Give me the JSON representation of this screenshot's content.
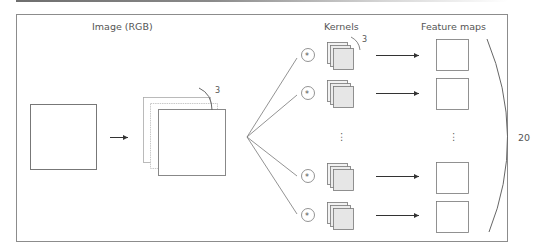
{
  "diagram": {
    "labels": {
      "image": "Image (RGB)",
      "kernels": "Kernels",
      "feature_maps": "Feature maps"
    },
    "channel_count": "3",
    "kernel_depth": "3",
    "feature_map_count": "20",
    "operator_symbol": "*",
    "ellipsis": "⋮",
    "rows": [
      {
        "kernel": "kernel-1",
        "feature_map": "feature-map-1"
      },
      {
        "kernel": "kernel-2",
        "feature_map": "feature-map-2"
      },
      {
        "kernel": "kernel-19",
        "feature_map": "feature-map-19"
      },
      {
        "kernel": "kernel-20",
        "feature_map": "feature-map-20"
      }
    ],
    "icons": {
      "convolution": "circled-asterisk-icon",
      "arrow": "right-arrow-icon",
      "brace": "curved-brace-icon"
    },
    "colors": {
      "stroke": "#777777",
      "kernel_fill": "#e6e6e6",
      "text": "#555555",
      "frame": "#8c8c8c"
    }
  }
}
